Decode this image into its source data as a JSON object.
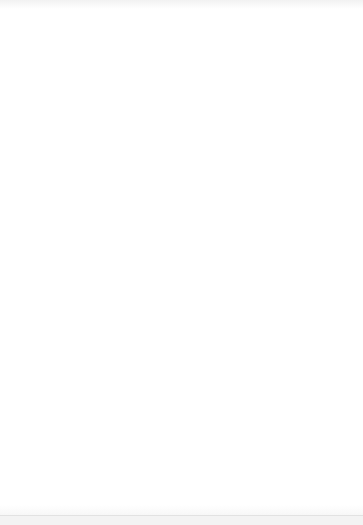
{
  "document": {
    "type": "hand-drawn site plan sketch",
    "media": "scanned paper drawing",
    "ink_color": "#1a1a1a",
    "paper_color": "#ffffff"
  },
  "sight_lines": [
    {
      "id": "no3",
      "label": "No 3",
      "measure": "17' - we",
      "arrow_tip": {
        "x": 108,
        "y": 37
      },
      "start": {
        "x": 115,
        "y": 22
      },
      "end": {
        "x": 212,
        "y": 470
      },
      "label_pos": {
        "x": 120,
        "y": 24
      },
      "measure_pos": {
        "x": 118,
        "y": 40
      }
    },
    {
      "id": "no1",
      "label": "No 1",
      "measure": "27'",
      "measure2": "two",
      "arrow_tip": {
        "x": 309,
        "y": 33
      },
      "start": {
        "x": 316,
        "y": 20
      },
      "end": {
        "x": 92,
        "y": 492
      },
      "label_pos": {
        "x": 320,
        "y": 28
      },
      "measure_pos": {
        "x": 318,
        "y": 46
      },
      "measure2_pos": {
        "x": 327,
        "y": 58
      }
    },
    {
      "id": "no2",
      "label": "No 2",
      "measure": "19' - we",
      "arrow_tip": {
        "x": 33,
        "y": 190
      },
      "start": {
        "x": 18,
        "y": 184
      },
      "end": {
        "x": 300,
        "y": 300
      },
      "label_pos": {
        "x": 18,
        "y": 200
      },
      "measure_pos": {
        "x": 17,
        "y": 212
      }
    }
  ],
  "ponds": [
    {
      "id": "pond2",
      "label": "POND 2",
      "label_pos": {
        "x": 86,
        "y": 107
      },
      "shape": {
        "cx": 103,
        "cy": 119,
        "rx": 13,
        "ry": 6
      }
    },
    {
      "id": "pond1",
      "label": "POND 1",
      "note": "(MORE TREES AREA)",
      "label_pos": {
        "x": 259,
        "y": 186
      },
      "note_pos": {
        "x": 292,
        "y": 186
      },
      "shape": {
        "cx": 236,
        "cy": 203,
        "rx": 14,
        "ry": 8
      }
    }
  ],
  "annotations": [
    {
      "id": "pipe-note",
      "text": "PIPE FROM DRAIN TO POND 2",
      "pos": {
        "x": 150,
        "y": 144
      }
    }
  ],
  "buildings": [
    {
      "id": "main-building",
      "label_lines": [
        "JOHNSON'S",
        "MCDONALD",
        "FLAT",
        "(MAIN BUILDING)"
      ],
      "label_pos": {
        "x": 73,
        "y": 240
      },
      "outline_weight": "thick",
      "points": "60,200 97,189 113,196 113,196 105,292 104,295 47,263"
    },
    {
      "id": "right-house",
      "label": "OUR HOUSE",
      "label_pos": {
        "x": 230,
        "y": 252
      },
      "outline_weight": "thin"
    },
    {
      "id": "coal-store",
      "label": "COAL",
      "label_pos": {
        "x": 153,
        "y": 292
      },
      "outline_weight": "thin"
    }
  ],
  "compass": {
    "id": "north-arrow",
    "letter": "N",
    "letter_pos": {
      "x": 288,
      "y": 472
    },
    "circle": {
      "cx": 292,
      "cy": 452,
      "r": 38
    }
  },
  "driveway": {
    "id": "driveway-sketch",
    "description": "curved drive with gate marker, bottom left"
  }
}
